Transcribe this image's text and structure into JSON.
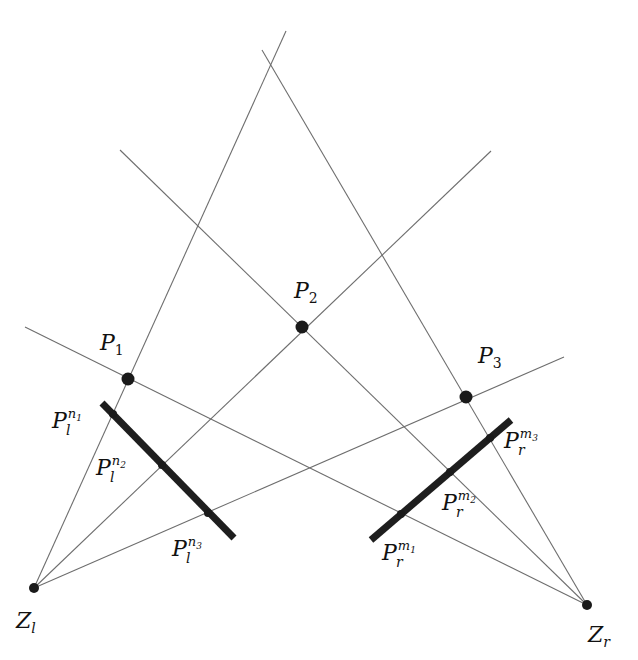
{
  "diagram": {
    "centers": [
      {
        "id": "Zl",
        "base": "Z",
        "sub": "l",
        "x": 34,
        "y": 588,
        "lx": 16,
        "ly": 628
      },
      {
        "id": "Zr",
        "base": "Z",
        "sub": "r",
        "x": 587,
        "y": 605,
        "lx": 588,
        "ly": 642
      }
    ],
    "scene_points": [
      {
        "id": "P1",
        "base": "P",
        "sub": "1",
        "x": 128,
        "y": 379,
        "lx": 100,
        "ly": 350
      },
      {
        "id": "P2",
        "base": "P",
        "sub": "2",
        "x": 302,
        "y": 327,
        "lx": 294,
        "ly": 298
      },
      {
        "id": "P3",
        "base": "P",
        "sub": "3",
        "x": 466,
        "y": 397,
        "lx": 478,
        "ly": 363
      }
    ],
    "rays": [
      {
        "from": "Zl",
        "x1": 34,
        "y1": 588,
        "x2": 286,
        "y2": 31
      },
      {
        "from": "Zl",
        "x1": 34,
        "y1": 588,
        "x2": 491,
        "y2": 151
      },
      {
        "from": "Zl",
        "x1": 34,
        "y1": 588,
        "x2": 564,
        "y2": 357
      },
      {
        "from": "Zr",
        "x1": 587,
        "y1": 605,
        "x2": 25,
        "y2": 327
      },
      {
        "from": "Zr",
        "x1": 587,
        "y1": 605,
        "x2": 120,
        "y2": 150
      },
      {
        "from": "Zr",
        "x1": 587,
        "y1": 605,
        "x2": 262,
        "y2": 50
      }
    ],
    "image_planes": [
      {
        "id": "left",
        "x1": 102,
        "y1": 403,
        "x2": 234,
        "y2": 538
      },
      {
        "id": "right",
        "x1": 371,
        "y1": 540,
        "x2": 511,
        "y2": 420
      }
    ],
    "projections": [
      {
        "id": "Pl_n1",
        "base": "P",
        "sub": "l",
        "sup": "n",
        "supsub": "1",
        "x": 113,
        "y": 414,
        "lx": 52,
        "ly": 428
      },
      {
        "id": "Pl_n2",
        "base": "P",
        "sub": "l",
        "sup": "n",
        "supsub": "2",
        "x": 162,
        "y": 465,
        "lx": 96,
        "ly": 475
      },
      {
        "id": "Pl_n3",
        "base": "P",
        "sub": "l",
        "sup": "n",
        "supsub": "3",
        "x": 208,
        "y": 513,
        "lx": 172,
        "ly": 556
      },
      {
        "id": "Pr_m1",
        "base": "P",
        "sub": "r",
        "sup": "m",
        "supsub": "1",
        "x": 401,
        "y": 514,
        "lx": 382,
        "ly": 560
      },
      {
        "id": "Pr_m2",
        "base": "P",
        "sub": "r",
        "sup": "m",
        "supsub": "2",
        "x": 450,
        "y": 472,
        "lx": 442,
        "ly": 510
      },
      {
        "id": "Pr_m3",
        "base": "P",
        "sub": "r",
        "sup": "m",
        "supsub": "3",
        "x": 490,
        "y": 438,
        "lx": 504,
        "ly": 448
      }
    ]
  }
}
